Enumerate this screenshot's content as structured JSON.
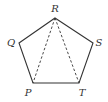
{
  "diagram": {
    "shape": "regular pentagon",
    "vertices": [
      {
        "name": "R",
        "x": 55,
        "y": 18,
        "label_x": 55,
        "label_y": 12
      },
      {
        "name": "S",
        "x": 93,
        "y": 43,
        "label_x": 99,
        "label_y": 46
      },
      {
        "name": "T",
        "x": 79,
        "y": 83,
        "label_x": 82,
        "label_y": 96
      },
      {
        "name": "P",
        "x": 33,
        "y": 83,
        "label_x": 28,
        "label_y": 96
      },
      {
        "name": "Q",
        "x": 19,
        "y": 43,
        "label_x": 11,
        "label_y": 46
      }
    ],
    "solid_edges": [
      "RS",
      "ST",
      "TP",
      "PQ",
      "QR"
    ],
    "dashed_segments": [
      "RP",
      "RT"
    ],
    "colors": {
      "line": "#333333",
      "label": "#333333",
      "background": "#ffffff"
    }
  },
  "labels": {
    "R": "R",
    "S": "S",
    "T": "T",
    "P": "P",
    "Q": "Q"
  }
}
